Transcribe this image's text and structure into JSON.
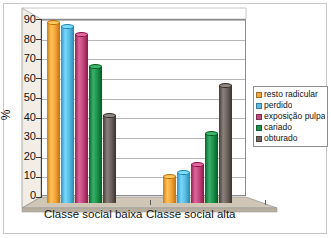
{
  "chart_data": {
    "type": "bar",
    "title": "",
    "subtitle": "",
    "xlabel": "",
    "ylabel": "%",
    "ylim": [
      0,
      90
    ],
    "ytick_step": 10,
    "yticks": [
      "0",
      "10",
      "20",
      "30",
      "40",
      "50",
      "60",
      "70",
      "80",
      "90"
    ],
    "grid": true,
    "grid_axis": "y",
    "legend_position": "right",
    "three_d": true,
    "categories": [
      "Classe social baixa",
      "Classe social alta"
    ],
    "series": [
      {
        "name": "resto radicular",
        "color": "#F5A63C",
        "values": [
          91,
          13
        ]
      },
      {
        "name": "perdido",
        "color": "#5BBCE4",
        "values": [
          89,
          15
        ]
      },
      {
        "name": "exposição pulpar",
        "color": "#C2497E",
        "values": [
          85,
          19
        ]
      },
      {
        "name": "cariado",
        "color": "#1E9350",
        "values": [
          69,
          35
        ]
      },
      {
        "name": "obturado",
        "color": "#6E6560",
        "values": [
          44,
          59
        ]
      }
    ]
  },
  "legend": {
    "items": [
      {
        "label": "resto radicular"
      },
      {
        "label": "perdido"
      },
      {
        "label": "exposição pulpar"
      },
      {
        "label": "cariado"
      },
      {
        "label": "obturado"
      }
    ]
  },
  "axes": {
    "y_axis_title": "%",
    "y_tick_labels": [
      "90",
      "80",
      "70",
      "60",
      "50",
      "40",
      "30",
      "20",
      "10",
      "0"
    ],
    "x_tick_labels": [
      "Classe social baixa",
      "Classe social alta"
    ]
  },
  "colors": {
    "series_1": "#F5A63C",
    "series_2": "#5BBCE4",
    "series_3": "#C2497E",
    "series_4": "#1E9350",
    "series_5": "#6E6560",
    "floor": "#CFC6B6",
    "wall": "#FFFFFF",
    "gridline": "#B5B5B5",
    "frame": "#C9C9C9",
    "axis": "#3A3A3A",
    "text": "#121212"
  }
}
